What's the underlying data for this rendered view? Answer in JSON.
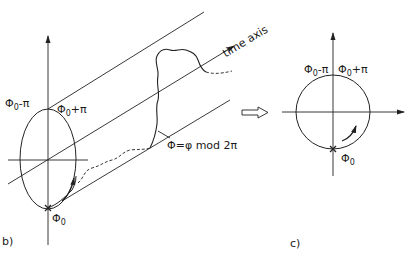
{
  "panel_b": {
    "label": "b)",
    "top_left_label": {
      "base": "Φ",
      "sub": "0",
      "rest": "-π"
    },
    "top_right_label": {
      "base": "Φ",
      "sub": "0",
      "rest": "+π"
    },
    "bottom_label": {
      "base": "Φ",
      "sub": "0"
    },
    "time_axis_label": "time axis",
    "formula_label": "Φ=φ mod 2π"
  },
  "transition_arrow": "hollow-right-arrow",
  "panel_c": {
    "label": "c)",
    "top_left_label": {
      "base": "Φ",
      "sub": "0",
      "rest": "-π"
    },
    "top_right_label": {
      "base": "Φ",
      "sub": "0",
      "rest": "+π"
    },
    "bottom_label": {
      "base": "Φ",
      "sub": "0"
    }
  },
  "colors": {
    "stroke": "#222222",
    "background": "#ffffff"
  }
}
